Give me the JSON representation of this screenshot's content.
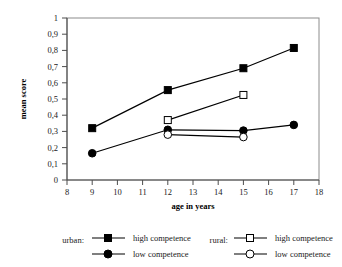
{
  "chart_data": {
    "type": "line",
    "title": "",
    "xlabel": "age in years",
    "ylabel": "mean score",
    "xlim": [
      8,
      18
    ],
    "ylim": [
      0,
      1
    ],
    "grid": false,
    "legend_position": "bottom",
    "x_ticks": [
      "8",
      "9",
      "10",
      "11",
      "12",
      "13",
      "14",
      "15",
      "16",
      "17",
      "18"
    ],
    "y_ticks": [
      "0",
      "0,1",
      "0,2",
      "0,3",
      "0,4",
      "0,5",
      "0,6",
      "0,7",
      "0,8",
      "0,9",
      "1"
    ],
    "series": [
      {
        "name": "urban: high competence",
        "group": "urban",
        "competence": "high competence",
        "marker": "filled-square",
        "x": [
          9,
          12,
          15,
          17
        ],
        "values": [
          0.32,
          0.555,
          0.69,
          0.815
        ]
      },
      {
        "name": "urban: low competence",
        "group": "urban",
        "competence": "low competence",
        "marker": "filled-circle",
        "x": [
          9,
          12,
          15,
          17
        ],
        "values": [
          0.165,
          0.31,
          0.305,
          0.34
        ]
      },
      {
        "name": "rural: high competence",
        "group": "rural",
        "competence": "high competence",
        "marker": "open-square",
        "x": [
          12,
          15
        ],
        "values": [
          0.37,
          0.525
        ]
      },
      {
        "name": "rural: low competence",
        "group": "rural",
        "competence": "low competence",
        "marker": "open-circle",
        "x": [
          12,
          15
        ],
        "values": [
          0.28,
          0.265
        ]
      }
    ]
  },
  "axes": {
    "y_label": "mean score",
    "x_label": "age in years",
    "y_ticks": [
      "1",
      "0,9",
      "0,8",
      "0,7",
      "0,6",
      "0,5",
      "0,4",
      "0,3",
      "0,2",
      "0,1",
      "0"
    ],
    "x_ticks": [
      "8",
      "9",
      "10",
      "11",
      "12",
      "13",
      "14",
      "15",
      "16",
      "17",
      "18"
    ]
  },
  "legend": {
    "groups": [
      {
        "label": "urban:",
        "entries": [
          {
            "marker": "filled-square",
            "text": "high competence"
          },
          {
            "marker": "filled-circle",
            "text": "low competence"
          }
        ]
      },
      {
        "label": "rural:",
        "entries": [
          {
            "marker": "open-square",
            "text": "high competence"
          },
          {
            "marker": "open-circle",
            "text": "low competence"
          }
        ]
      }
    ]
  },
  "colors": {
    "line": "#000000",
    "frame": "#8c8c8c",
    "axis": "#4d4d4d",
    "background": "#ffffff"
  }
}
